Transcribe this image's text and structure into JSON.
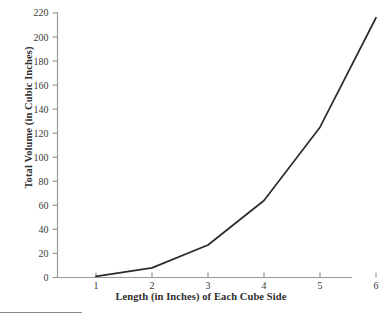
{
  "chart_data": {
    "type": "line",
    "title": "",
    "xlabel": "Length (in Inches) of Each Cube Side",
    "ylabel": "Total Volume (in Cubic Inches)",
    "x": [
      1,
      2,
      3,
      4,
      5,
      6
    ],
    "y": [
      1,
      8,
      27,
      64,
      125,
      216
    ],
    "series": [
      {
        "name": "Total Volume",
        "values": [
          1,
          8,
          27,
          64,
          125,
          216
        ]
      }
    ],
    "xlim": [
      0.5,
      6.45
    ],
    "ylim": [
      0,
      220
    ],
    "xticks": [
      "1",
      "2",
      "3",
      "4",
      "5",
      "6"
    ],
    "yticks": [
      "0",
      "20",
      "40",
      "60",
      "80",
      "100",
      "120",
      "140",
      "160",
      "180",
      "200",
      "220"
    ],
    "grid": false,
    "legend": "none",
    "line_color": "#2b2b2b",
    "axis_color": "#9a9a9a"
  },
  "axis": {
    "x_title": "Length (in Inches) of Each Cube Side",
    "y_title": "Total Volume (in Cubic Inches)"
  }
}
